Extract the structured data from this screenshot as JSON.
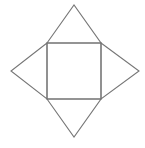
{
  "diagram": {
    "type": "square-pyramid-net",
    "canvas": {
      "width": 145,
      "height": 148
    },
    "stroke_color": "#767676",
    "background_color": "#ffffff",
    "stroke_width": 1.1,
    "base_square": {
      "x1": 47,
      "y1": 43,
      "x2": 101,
      "y2": 99
    },
    "triangles": [
      {
        "name": "top-triangle",
        "points": [
          [
            47,
            43
          ],
          [
            74,
            5
          ],
          [
            101,
            43
          ]
        ]
      },
      {
        "name": "right-triangle",
        "points": [
          [
            101,
            43
          ],
          [
            139,
            71
          ],
          [
            101,
            99
          ]
        ]
      },
      {
        "name": "bottom-triangle",
        "points": [
          [
            47,
            99
          ],
          [
            74,
            137
          ],
          [
            101,
            99
          ]
        ]
      },
      {
        "name": "left-triangle",
        "points": [
          [
            47,
            43
          ],
          [
            11,
            71
          ],
          [
            47,
            99
          ]
        ]
      }
    ]
  }
}
